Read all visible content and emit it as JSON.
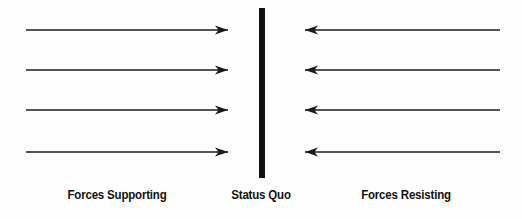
{
  "diagram": {
    "type": "force-field-analysis",
    "title": "",
    "background_color": "#fefefe",
    "stroke_color": "#1a1a1a",
    "center_bar": {
      "name": "status-quo-bar",
      "x": 262,
      "y_top": 8,
      "y_bottom": 178,
      "width": 6,
      "color": "#111111"
    },
    "left_side": {
      "label": "Forces Supporting",
      "direction": "right",
      "arrow_count": 4,
      "line_start_x": 26,
      "line_end_x": 228,
      "rows_y": [
        30,
        70,
        110,
        152
      ]
    },
    "right_side": {
      "label": "Forces Resisting",
      "direction": "left",
      "arrow_count": 4,
      "line_start_x": 305,
      "line_end_x": 500,
      "rows_y": [
        30,
        70,
        110,
        152
      ]
    },
    "center_label": "Status Quo"
  },
  "labels": {
    "supporting": "Forces Supporting",
    "status_quo": "Status Quo",
    "resisting": "Forces Resisting"
  }
}
